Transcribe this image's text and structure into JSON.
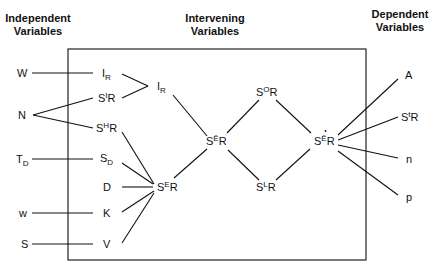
{
  "headers": {
    "independent": [
      "Independent",
      "Variables"
    ],
    "intervening": [
      "Intervening",
      "Variables"
    ],
    "dependent": [
      "Dependent",
      "Variables"
    ]
  },
  "independent_variables": [
    {
      "id": "W",
      "base": "W",
      "sub": ""
    },
    {
      "id": "N",
      "base": "N",
      "sub": ""
    },
    {
      "id": "TD",
      "base": "T",
      "sub": "D"
    },
    {
      "id": "w",
      "base": "w",
      "sub": ""
    },
    {
      "id": "S",
      "base": "S",
      "sub": ""
    }
  ],
  "intervening_variables": [
    {
      "id": "IR_1",
      "base": "I",
      "sup": "",
      "sub": "R"
    },
    {
      "id": "SIR",
      "base": "S",
      "sup": "I",
      "sub": "R"
    },
    {
      "id": "SHR",
      "base": "S",
      "sup": "H",
      "sub": "R"
    },
    {
      "id": "SD",
      "base": "S",
      "sup": "",
      "sub": "D"
    },
    {
      "id": "D",
      "base": "D",
      "sup": "",
      "sub": ""
    },
    {
      "id": "K",
      "base": "K",
      "sup": "",
      "sub": ""
    },
    {
      "id": "V",
      "base": "V",
      "sup": "",
      "sub": ""
    },
    {
      "id": "IR_2",
      "base": "I",
      "sup": "",
      "sub": "R"
    },
    {
      "id": "SER",
      "base": "S",
      "sup": "E",
      "sub": "R"
    },
    {
      "id": "SEbarR",
      "base": "S",
      "sup": "Ē",
      "sub": "R"
    },
    {
      "id": "SOR",
      "base": "S",
      "sup": "O",
      "sub": "R"
    },
    {
      "id": "SLR",
      "base": "S",
      "sup": "L",
      "sub": "R"
    },
    {
      "id": "SEdotR",
      "base": "S",
      "sup": "Ē̇",
      "sub": "R"
    }
  ],
  "dependent_variables": [
    {
      "id": "A",
      "base": "A",
      "sup": "",
      "sub": ""
    },
    {
      "id": "StR",
      "base": "S",
      "sup": "t",
      "sub": "R"
    },
    {
      "id": "n",
      "base": "n",
      "sup": "",
      "sub": ""
    },
    {
      "id": "p",
      "base": "p",
      "sup": "",
      "sub": ""
    }
  ],
  "edges": [
    [
      "W",
      "IR_1"
    ],
    [
      "N",
      "SIR"
    ],
    [
      "N",
      "SHR"
    ],
    [
      "TD",
      "SD"
    ],
    [
      "w",
      "K"
    ],
    [
      "S",
      "V"
    ],
    [
      "IR_1",
      "IR_2"
    ],
    [
      "SIR",
      "IR_2"
    ],
    [
      "IR_2",
      "SEbarR"
    ],
    [
      "SHR",
      "SER"
    ],
    [
      "SD",
      "SER"
    ],
    [
      "D",
      "SER"
    ],
    [
      "K",
      "SER"
    ],
    [
      "V",
      "SER"
    ],
    [
      "SER",
      "SEbarR"
    ],
    [
      "SEbarR",
      "SOR"
    ],
    [
      "SEbarR",
      "SLR"
    ],
    [
      "SOR",
      "SEdotR"
    ],
    [
      "SLR",
      "SEdotR"
    ],
    [
      "SEdotR",
      "A"
    ],
    [
      "SEdotR",
      "StR"
    ],
    [
      "SEdotR",
      "n"
    ],
    [
      "SEdotR",
      "p"
    ]
  ],
  "labels": {
    "W": "W",
    "N": "N",
    "T": "T",
    "D_sub": "D",
    "w": "w",
    "S": "S",
    "I": "I",
    "R": "R",
    "SBase": "S",
    "Isup": "I",
    "Hsup": "H",
    "Esup": "E",
    "Ebar": "Ē",
    "Osup": "O",
    "Lsup": "L",
    "tsup": "t",
    "dot": "·",
    "D": "D",
    "K": "K",
    "V": "V",
    "A": "A",
    "n": "n",
    "p": "p"
  }
}
